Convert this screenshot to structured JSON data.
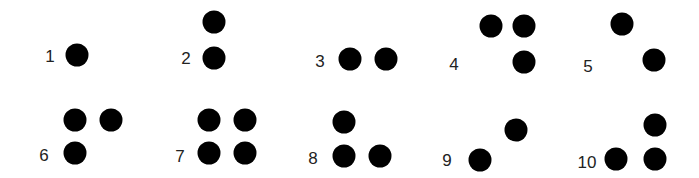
{
  "colors": {
    "dot": "#000000",
    "label": "#222222",
    "background": "#ffffff"
  },
  "cells": [
    {
      "number": "1",
      "label_pos": [
        50,
        56
      ],
      "dots": [
        [
          77,
          55
        ]
      ]
    },
    {
      "number": "2",
      "label_pos": [
        186,
        58
      ],
      "dots": [
        [
          214,
          22
        ],
        [
          214,
          58
        ]
      ]
    },
    {
      "number": "3",
      "label_pos": [
        320,
        61
      ],
      "dots": [
        [
          350,
          59
        ],
        [
          386,
          59
        ]
      ]
    },
    {
      "number": "4",
      "label_pos": [
        454,
        64
      ],
      "dots": [
        [
          491,
          26
        ],
        [
          524,
          26
        ],
        [
          524,
          62
        ]
      ]
    },
    {
      "number": "5",
      "label_pos": [
        588,
        66
      ],
      "dots": [
        [
          622,
          24
        ],
        [
          654,
          60
        ]
      ]
    },
    {
      "number": "6",
      "label_pos": [
        44,
        155
      ],
      "dots": [
        [
          75,
          120
        ],
        [
          111,
          120
        ],
        [
          75,
          153
        ]
      ]
    },
    {
      "number": "7",
      "label_pos": [
        180,
        156
      ],
      "dots": [
        [
          209,
          120
        ],
        [
          245,
          120
        ],
        [
          209,
          153
        ],
        [
          245,
          153
        ]
      ]
    },
    {
      "number": "8",
      "label_pos": [
        313,
        158
      ],
      "dots": [
        [
          344,
          122
        ],
        [
          344,
          156
        ],
        [
          380,
          156
        ]
      ]
    },
    {
      "number": "9",
      "label_pos": [
        447,
        160
      ],
      "dots": [
        [
          516,
          130
        ],
        [
          480,
          160
        ]
      ]
    },
    {
      "number": "10",
      "label_pos": [
        587,
        162
      ],
      "dots": [
        [
          616,
          159
        ],
        [
          655,
          125
        ],
        [
          655,
          159
        ]
      ]
    }
  ]
}
